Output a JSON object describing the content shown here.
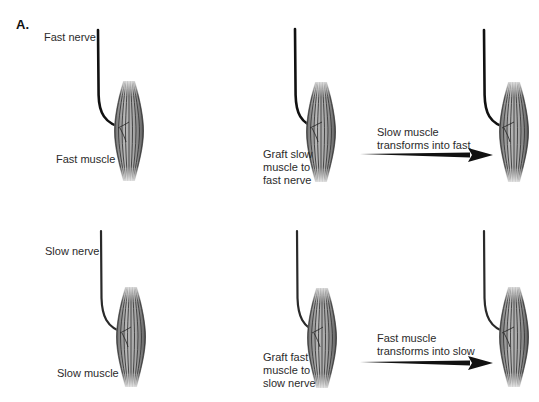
{
  "figure": {
    "panel_label": "A.",
    "rows": [
      {
        "id": "fast-row",
        "control": {
          "nerve_label": "Fast nerve",
          "muscle_label": "Fast muscle"
        },
        "graft": {
          "label_lines": [
            "Graft slow",
            "muscle to",
            "fast nerve"
          ]
        },
        "transformation": {
          "label_lines": [
            "Slow muscle",
            "transforms into fast"
          ]
        }
      },
      {
        "id": "slow-row",
        "control": {
          "nerve_label": "Slow nerve",
          "muscle_label": "Slow muscle"
        },
        "graft": {
          "label_lines": [
            "Graft fast",
            "muscle to",
            "slow nerve"
          ]
        },
        "transformation": {
          "label_lines": [
            "Fast muscle",
            "transforms into slow"
          ]
        }
      }
    ],
    "colors": {
      "nerve": "#111111",
      "muscle_fiber": "#3a3a3a",
      "muscle_fill": "#9a9a9a",
      "arrow": "#111111",
      "text": "#2b2b2b"
    }
  }
}
